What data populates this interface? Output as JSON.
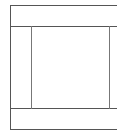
{
  "diagram": {
    "type": "wireframe-layout",
    "stroke_color": "#555555",
    "background": "#ffffff",
    "regions": [
      {
        "name": "header",
        "label": ""
      },
      {
        "name": "left-sidebar",
        "label": ""
      },
      {
        "name": "main-content",
        "label": ""
      },
      {
        "name": "right-sidebar",
        "label": ""
      },
      {
        "name": "footer",
        "label": ""
      }
    ]
  }
}
